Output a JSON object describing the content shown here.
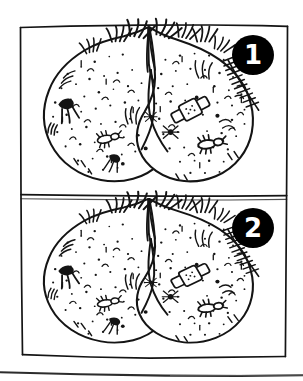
{
  "figure": {
    "kind": "hand-drawn-line-illustration",
    "medium": "black ink on white paper, photocopied",
    "colors": {
      "ink": "#111111",
      "paper": "#ffffff",
      "badge_fill": "#000000",
      "badge_numeral": "#ffffff"
    },
    "panel_count": 2,
    "caption_line_present": true
  },
  "panels": [
    {
      "id": "panel-1",
      "badge_number": "1",
      "badge_position": "top-right",
      "subject": "two-lobed rounded body form",
      "features": [
        "speckled skin texture",
        "hair tufts along upper edge",
        "dark hairy tuft on left flank",
        "adhesive bandage on right lobe",
        "suture stitches on upper right lobe",
        "small insect-like marks",
        "assorted moles and blemishes"
      ]
    },
    {
      "id": "panel-2",
      "badge_number": "2",
      "badge_position": "top-right",
      "subject": "two-lobed rounded body form",
      "features": [
        "speckled skin texture",
        "hair tufts along upper edge",
        "dark hairy tuft on left flank",
        "adhesive bandage on right lobe",
        "suture stitches on upper right lobe",
        "small insect-like marks",
        "assorted moles and blemishes"
      ]
    }
  ],
  "annotations": {
    "frame_style": "hand-ruled rectangle, slightly skewed",
    "divider_style": "single horizontal hand-ruled line",
    "bottom_rule": "thin slanted page-edge line"
  }
}
